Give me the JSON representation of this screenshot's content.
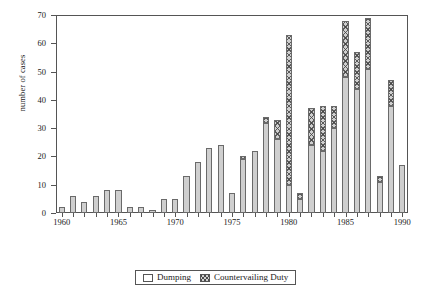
{
  "chart_data": {
    "type": "bar",
    "title": "",
    "xlabel": "",
    "ylabel": "number of cases",
    "ylim": [
      0,
      70
    ],
    "yticks": [
      0,
      10,
      20,
      30,
      40,
      50,
      60,
      70
    ],
    "xlim": [
      1959.5,
      1990.5
    ],
    "xticks": [
      1960,
      1965,
      1970,
      1975,
      1980,
      1985,
      1990
    ],
    "grid": false,
    "stacked": true,
    "legend_position": "bottom",
    "categories": [
      1960,
      1961,
      1962,
      1963,
      1964,
      1965,
      1966,
      1967,
      1968,
      1969,
      1970,
      1971,
      1972,
      1973,
      1974,
      1975,
      1976,
      1977,
      1978,
      1979,
      1980,
      1981,
      1982,
      1983,
      1984,
      1985,
      1986,
      1987,
      1988,
      1989,
      1990
    ],
    "series": [
      {
        "name": "Dumping",
        "values": [
          2,
          6,
          4,
          6,
          8,
          8,
          2,
          2,
          1,
          5,
          5,
          13,
          18,
          23,
          24,
          7,
          19,
          22,
          32,
          26,
          10,
          5,
          24,
          22,
          30,
          48,
          44,
          51,
          11,
          38,
          17
        ]
      },
      {
        "name": "Countervailing Duty",
        "values": [
          0,
          0,
          0,
          0,
          0,
          0,
          0,
          0,
          0,
          0,
          0,
          0,
          0,
          0,
          0,
          0,
          1,
          0,
          2,
          7,
          53,
          2,
          13,
          16,
          8,
          20,
          13,
          18,
          2,
          9,
          0
        ]
      }
    ],
    "totals": [
      2,
      6,
      4,
      6,
      8,
      8,
      2,
      2,
      1,
      5,
      5,
      13,
      18,
      23,
      24,
      7,
      20,
      22,
      34,
      33,
      63,
      7,
      37,
      38,
      38,
      68,
      57,
      69,
      13,
      47,
      17
    ]
  },
  "legend": {
    "entries": [
      {
        "label": "Dumping",
        "swatch": "empty-square-swatch"
      },
      {
        "label": "Countervailing Duty",
        "swatch": "hatched-square-swatch"
      }
    ]
  }
}
